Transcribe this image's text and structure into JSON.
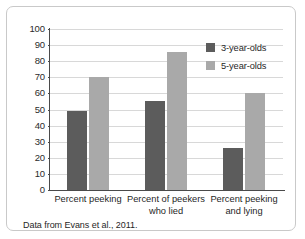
{
  "figure": {
    "source_note": "Data from Evans et al., 2011."
  },
  "legend": {
    "position": "top-right",
    "entries": [
      {
        "label": "3-year-olds",
        "color": "#5c5c5c",
        "swatch": "dark"
      },
      {
        "label": "5-year-olds",
        "color": "#a9a9a9",
        "swatch": "light"
      }
    ]
  },
  "chart_data": {
    "type": "bar",
    "title": "",
    "xlabel": "",
    "ylabel": "",
    "ylim": [
      0,
      100
    ],
    "ytick_values": [
      0,
      10,
      20,
      30,
      40,
      50,
      60,
      70,
      80,
      90,
      100
    ],
    "ytick_labels": [
      "0",
      "10",
      "20",
      "30",
      "40",
      "50",
      "60",
      "70",
      "80",
      "90",
      "100"
    ],
    "grid": true,
    "categories": [
      "Percent peeking",
      "Percent of peekers who lied",
      "Percent peeking and lying"
    ],
    "category_lines": [
      [
        "Percent peeking"
      ],
      [
        "Percent of peekers",
        "who lied"
      ],
      [
        "Percent peeking",
        "and lying"
      ]
    ],
    "series": [
      {
        "name": "3-year-olds",
        "color": "#5c5c5c",
        "values": [
          49,
          55,
          26
        ]
      },
      {
        "name": "5-year-olds",
        "color": "#a9a9a9",
        "values": [
          70,
          86,
          60
        ]
      }
    ]
  }
}
